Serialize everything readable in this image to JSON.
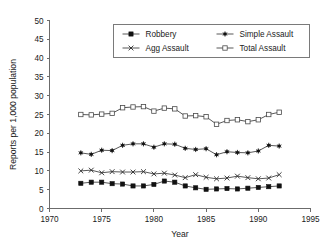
{
  "chart_data": {
    "type": "line",
    "title": "",
    "xlabel": "Year",
    "ylabel": "Reports per 1,000 population",
    "xlim": [
      1970,
      1995
    ],
    "ylim": [
      0,
      50
    ],
    "grid": false,
    "legend_position": "top-center",
    "x_ticks": [
      1970,
      1975,
      1980,
      1985,
      1990,
      1995
    ],
    "y_ticks": [
      0,
      5,
      10,
      15,
      20,
      25,
      30,
      35,
      40,
      45,
      50
    ],
    "x": [
      1973,
      1974,
      1975,
      1976,
      1977,
      1978,
      1979,
      1980,
      1981,
      1982,
      1983,
      1984,
      1985,
      1986,
      1987,
      1988,
      1989,
      1990,
      1991,
      1992
    ],
    "series": [
      {
        "name": "Robbery",
        "marker": "filled-square",
        "values": [
          6.7,
          7.0,
          7.0,
          6.6,
          6.5,
          6.0,
          6.0,
          6.4,
          7.3,
          7.0,
          6.0,
          5.5,
          5.1,
          5.2,
          5.3,
          5.2,
          5.4,
          5.6,
          5.8,
          6.0
        ]
      },
      {
        "name": "Agg Assault",
        "marker": "x",
        "values": [
          10.0,
          10.2,
          9.5,
          9.8,
          9.7,
          9.7,
          9.8,
          9.2,
          9.4,
          8.9,
          8.2,
          9.0,
          8.3,
          7.9,
          8.1,
          8.6,
          8.2,
          7.9,
          8.1,
          9.0
        ]
      },
      {
        "name": "Simple Assault",
        "marker": "star",
        "values": [
          14.8,
          14.4,
          15.5,
          15.4,
          16.8,
          17.2,
          17.2,
          16.3,
          17.2,
          17.1,
          16.0,
          15.7,
          15.9,
          14.3,
          15.1,
          14.9,
          14.8,
          15.3,
          16.8,
          16.6
        ]
      },
      {
        "name": "Total Assault",
        "marker": "open-square",
        "values": [
          25.0,
          24.9,
          25.1,
          25.3,
          26.8,
          27.0,
          27.1,
          25.9,
          26.7,
          26.5,
          24.6,
          24.7,
          24.4,
          22.4,
          23.4,
          23.6,
          23.1,
          23.6,
          25.0,
          25.6
        ]
      }
    ],
    "legend_entries": [
      {
        "label": "Robbery",
        "marker": "filled-square"
      },
      {
        "label": "Simple Assault",
        "marker": "star"
      },
      {
        "label": "Agg Assault",
        "marker": "x"
      },
      {
        "label": "Total Assault",
        "marker": "open-square"
      }
    ],
    "colors": {
      "axis": "#6b6b6b",
      "line": "#3a3a3a",
      "text": "#1a1a1a",
      "background": "#ffffff"
    }
  }
}
